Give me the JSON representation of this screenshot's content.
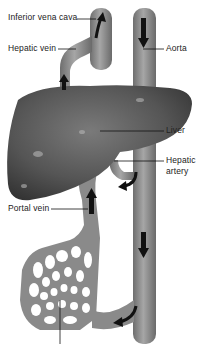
{
  "diagram": {
    "labels": {
      "inferior_vena_cava": "Inferior vena cava",
      "hepatic_vein": "Hepatic vein",
      "aorta": "Aorta",
      "liver": "Liver",
      "hepatic_artery_line1": "Hepatic",
      "hepatic_artery_line2": "artery",
      "portal_vein": "Portal vein"
    },
    "colors": {
      "vessel": "#8a8a8a",
      "vessel_dark": "#5e5e5e",
      "liver": "#555555",
      "liver_highlight": "#9a9a9a",
      "arrow": "#111111",
      "leader_line": "#111111",
      "background": "#ffffff"
    }
  }
}
